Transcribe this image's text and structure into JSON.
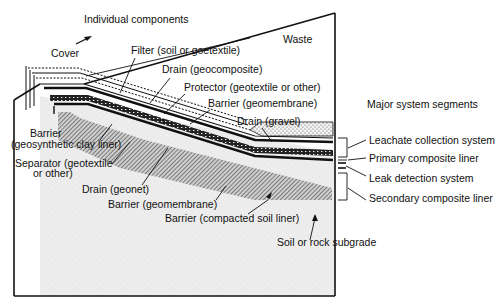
{
  "diagram": {
    "headings": {
      "individual_components": "Individual components",
      "major_system_segments": "Major system segments"
    },
    "region_labels": {
      "cover": "Cover",
      "waste": "Waste",
      "subgrade": "Soil or rock subgrade"
    },
    "components": [
      {
        "id": "filter",
        "text": "Filter (soil or goetextile)"
      },
      {
        "id": "drain_geocomposite",
        "text": "Drain (geocomposite)"
      },
      {
        "id": "protector",
        "text": "Protector (geotextile or other)"
      },
      {
        "id": "barrier_geomembrane_top",
        "text": "Barrier (geomembrane)"
      },
      {
        "id": "drain_gravel",
        "text": "Drain (gravel)"
      },
      {
        "id": "barrier_gcl_1",
        "text": "Barrier"
      },
      {
        "id": "barrier_gcl_2",
        "text": "(geosynthetic clay liner)"
      },
      {
        "id": "separator_1",
        "text": "Separator (geotextile"
      },
      {
        "id": "separator_2",
        "text": "or other)"
      },
      {
        "id": "drain_geonet",
        "text": "Drain (geonet)"
      },
      {
        "id": "barrier_geomembrane_bottom",
        "text": "Barrier (geomembrane)"
      },
      {
        "id": "barrier_csl",
        "text": "Barrier (compacted soil liner)"
      }
    ],
    "segments": [
      {
        "id": "leachate",
        "text": "Leachate collection system"
      },
      {
        "id": "primary",
        "text": "Primary composite liner"
      },
      {
        "id": "leak",
        "text": "Leak detection system"
      },
      {
        "id": "secondary",
        "text": "Secondary composite liner"
      }
    ],
    "colors": {
      "ink": "#111111",
      "paper": "#ffffff",
      "ground": "#e6e6e6"
    }
  }
}
